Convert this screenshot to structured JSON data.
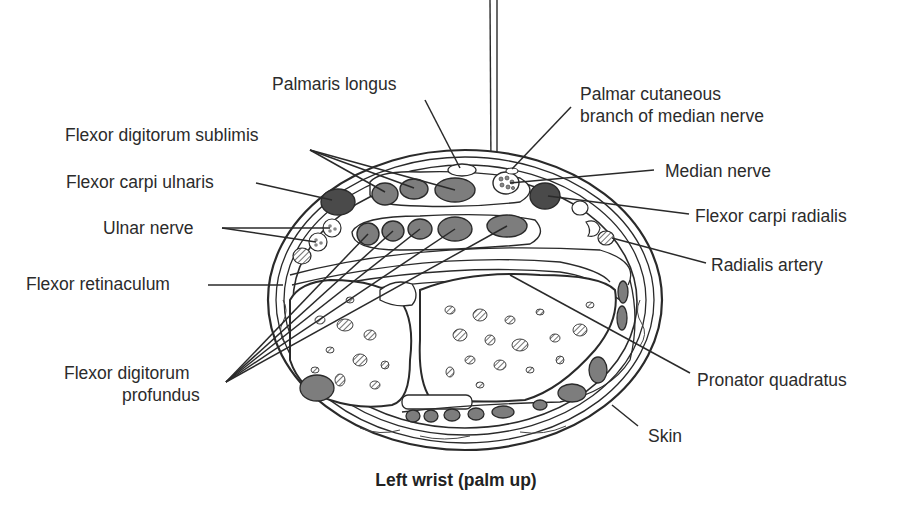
{
  "figure": {
    "caption": "Left wrist (palm up)",
    "labels": {
      "palmaris_longus": "Palmaris longus",
      "palmar_cutaneous_line1": "Palmar cutaneous",
      "palmar_cutaneous_line2": "branch of median nerve",
      "flexor_digitorum_sublimis": "Flexor digitorum sublimis",
      "flexor_carpi_ulnaris": "Flexor carpi ulnaris",
      "ulnar_nerve": "Ulnar nerve",
      "flexor_retinaculum": "Flexor retinaculum",
      "flexor_digitorum_profundus_line1": "Flexor digitorum",
      "flexor_digitorum_profundus_line2": "profundus",
      "median_nerve": "Median nerve",
      "flexor_carpi_radialis": "Flexor carpi radialis",
      "radialis_artery": "Radialis artery",
      "pronator_quadratus": "Pronator quadratus",
      "skin": "Skin"
    },
    "colors": {
      "line": "#2a2a2a",
      "tendon_fill": "#7d7d7d",
      "tendon_dark": "#4a4a4a",
      "background": "#ffffff"
    }
  }
}
